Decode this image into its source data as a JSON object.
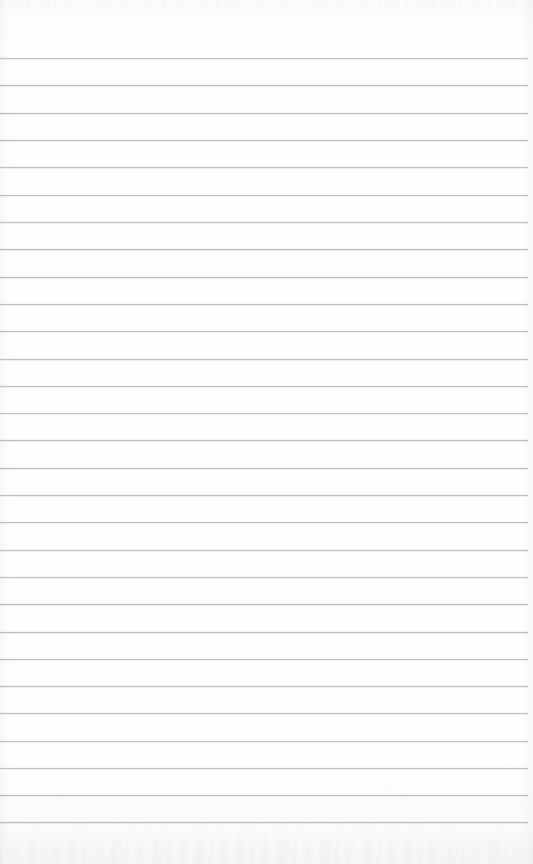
{
  "document": {
    "kind": "scanned-ruled-notebook-page",
    "title": "Blank Ruled Notebook Page",
    "page_width": 533,
    "page_height": 864,
    "written_content": "",
    "visible_text": ""
  },
  "paper": {
    "background_color": "#fdfdfd",
    "edge_tint_color": "#bec0c6",
    "texture_present": true,
    "texture_regions": [
      "top-edge",
      "bottom-edge"
    ]
  },
  "ruling": {
    "line_color": "#b7bac2",
    "line_thickness_px": 1,
    "line_count": 29,
    "first_line_y": 58,
    "line_pitch_px": 27.3,
    "line_start_x": 0,
    "line_end_x": 528,
    "margin_rule_present": false,
    "header_rule_present": false,
    "top_margin_px": 58,
    "bottom_margin_px": 42,
    "line_y_positions": [
      58,
      85,
      113,
      140,
      167,
      195,
      222,
      249,
      277,
      304,
      331,
      359,
      386,
      413,
      440,
      468,
      495,
      522,
      550,
      577,
      604,
      632,
      659,
      686,
      713,
      741,
      768,
      795,
      822
    ]
  },
  "labels": {
    "page_region": "notebook-page",
    "rule_region": "ruled-lines-area",
    "top_margin": "top-margin-area",
    "bottom_margin": "bottom-margin-area"
  }
}
